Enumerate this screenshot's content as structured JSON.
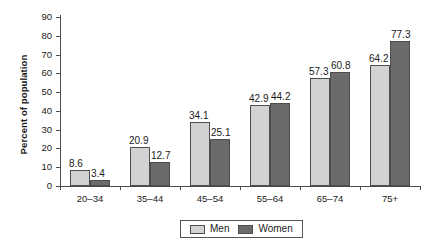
{
  "chart_data": {
    "type": "bar",
    "title": "",
    "xlabel": "",
    "ylabel": "Percent of population",
    "ylim": [
      0,
      90
    ],
    "ytick_step": 10,
    "yticks": [
      0,
      10,
      20,
      30,
      40,
      50,
      60,
      70,
      80,
      90
    ],
    "grid": false,
    "legend_position": "bottom-center",
    "categories": [
      "20–34",
      "35–44",
      "45–54",
      "55–64",
      "65–74",
      "75+"
    ],
    "series": [
      {
        "name": "Men",
        "color": "#d2d2d2",
        "values": [
          8.6,
          20.9,
          34.1,
          42.9,
          57.3,
          64.2
        ]
      },
      {
        "name": "Women",
        "color": "#6b6b6b",
        "values": [
          3.4,
          12.7,
          25.1,
          44.2,
          60.8,
          77.3
        ]
      }
    ],
    "value_labels": {
      "men": [
        "8.6",
        "20.9",
        "34.1",
        "42.9",
        "57.3",
        "64.2"
      ],
      "women": [
        "3.4",
        "12.7",
        "25.1",
        "44.2",
        "60.8",
        "77.3"
      ]
    }
  },
  "legend": {
    "items": [
      {
        "label": "Men",
        "swatch": "#d2d2d2"
      },
      {
        "label": "Women",
        "swatch": "#6b6b6b"
      }
    ]
  },
  "colors": {
    "men": "#d2d2d2",
    "women": "#6b6b6b",
    "axis": "#4d4d4d",
    "background": "#ffffff",
    "text": "#1a1a1a"
  }
}
